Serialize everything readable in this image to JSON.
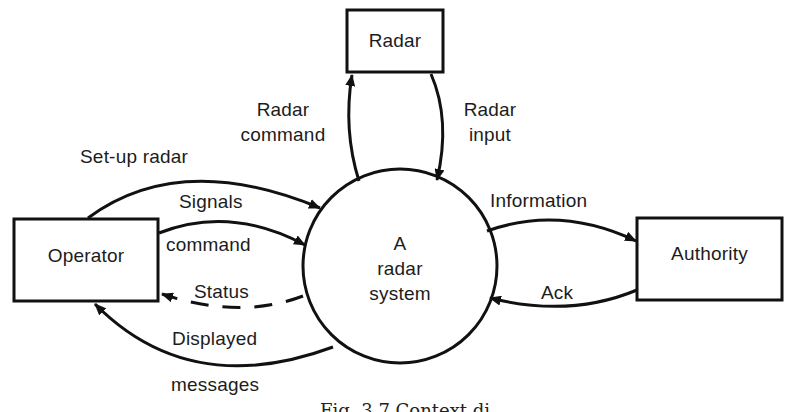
{
  "diagram": {
    "type": "context-diagram",
    "process": {
      "label_lines": [
        "A",
        "radar",
        "system"
      ]
    },
    "entities": {
      "radar": {
        "label": "Radar"
      },
      "operator": {
        "label": "Operator"
      },
      "authority": {
        "label": "Authority"
      }
    },
    "flows": {
      "radar_command": {
        "line1": "Radar",
        "line2": "command",
        "from": "A radar system",
        "to": "Radar",
        "style": "solid"
      },
      "radar_input": {
        "line1": "Radar",
        "line2": "input",
        "from": "Radar",
        "to": "A radar system",
        "style": "solid"
      },
      "setup_radar": {
        "label": "Set-up radar",
        "from": "Operator",
        "to": "A radar system",
        "style": "solid"
      },
      "signals_command": {
        "line1": "Signals",
        "line2": "command",
        "from": "Operator",
        "to": "A radar system",
        "style": "solid"
      },
      "status": {
        "label": "Status",
        "from": "A radar system",
        "to": "Operator",
        "style": "dashed"
      },
      "displayed_messages": {
        "line1": "Displayed",
        "line2": "messages",
        "from": "A radar system",
        "to": "Operator",
        "style": "solid"
      },
      "information": {
        "label": "Information",
        "from": "A radar system",
        "to": "Authority",
        "style": "solid"
      },
      "ack": {
        "label": "Ack",
        "from": "Authority",
        "to": "A radar system",
        "style": "solid"
      }
    },
    "caption": "Fig. 3.7 Context di"
  },
  "colors": {
    "ink": "#111111",
    "paper": "#ffffff"
  }
}
